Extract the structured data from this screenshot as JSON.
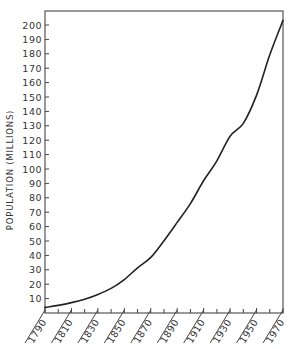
{
  "chart_data": {
    "type": "line",
    "title": "",
    "xlabel": "",
    "ylabel": "POPULATION (MILLIONS)",
    "x": [
      1790,
      1800,
      1810,
      1820,
      1830,
      1840,
      1850,
      1860,
      1870,
      1880,
      1890,
      1900,
      1910,
      1920,
      1930,
      1940,
      1950,
      1960,
      1970
    ],
    "series": [
      {
        "name": "Population",
        "values": [
          3.9,
          5.3,
          7.2,
          9.6,
          12.9,
          17.1,
          23.2,
          31.4,
          38.6,
          50.2,
          62.9,
          76.0,
          92.0,
          105.7,
          122.8,
          131.7,
          151.3,
          179.3,
          203.2
        ]
      }
    ],
    "xlim": [
      1790,
      1970
    ],
    "ylim": [
      0,
      205
    ],
    "x_tick_labels": [
      "1790",
      "1810",
      "1830",
      "1850",
      "1870",
      "1890",
      "1910",
      "1930",
      "1950",
      "1970"
    ],
    "x_minor_ticks": [
      1800,
      1820,
      1840,
      1860,
      1880,
      1900,
      1920,
      1940,
      1960
    ],
    "y_tick_labels": [
      "10",
      "20",
      "30",
      "40",
      "50",
      "60",
      "70",
      "80",
      "90",
      "100",
      "110",
      "120",
      "130",
      "140",
      "150",
      "160",
      "170",
      "180",
      "190",
      "200"
    ],
    "grid": false,
    "legend": "none"
  }
}
